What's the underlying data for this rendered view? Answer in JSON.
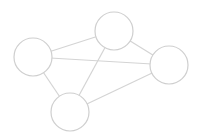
{
  "diagram": {
    "type": "undirected-graph",
    "stroke_color": "#cfcfcf",
    "background": "#ffffff",
    "nodes": [
      {
        "id": "A",
        "cx": 33,
        "cy": 57,
        "r": 19
      },
      {
        "id": "B",
        "cx": 114,
        "cy": 31,
        "r": 19
      },
      {
        "id": "C",
        "cx": 169,
        "cy": 65,
        "r": 19
      },
      {
        "id": "D",
        "cx": 70,
        "cy": 112,
        "r": 19
      }
    ],
    "edges": [
      {
        "from": "A",
        "to": "B"
      },
      {
        "from": "A",
        "to": "C"
      },
      {
        "from": "A",
        "to": "D"
      },
      {
        "from": "B",
        "to": "C"
      },
      {
        "from": "B",
        "to": "D"
      },
      {
        "from": "D",
        "to": "C"
      }
    ]
  }
}
